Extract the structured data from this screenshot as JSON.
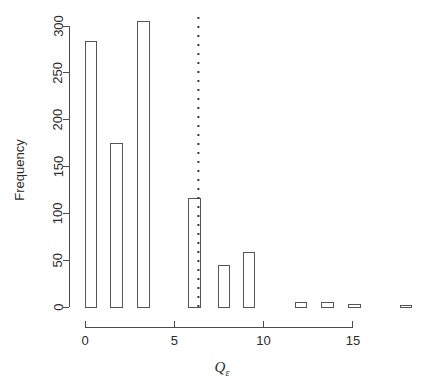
{
  "chart_data": {
    "type": "bar",
    "title": "",
    "subtitle": "",
    "xlabel": "Q",
    "xlabel_subscript": "ε",
    "ylabel": "Frequency",
    "xlim": [
      -0.6,
      18.2
    ],
    "ylim": [
      0,
      312
    ],
    "grid": false,
    "legend": null,
    "bin_width": 0.65,
    "bars": [
      {
        "left": 0.0,
        "right": 0.65,
        "center": 0.33,
        "value": 283
      },
      {
        "left": 1.45,
        "right": 2.1,
        "center": 1.78,
        "value": 175
      },
      {
        "left": 2.95,
        "right": 3.6,
        "center": 3.28,
        "value": 305
      },
      {
        "left": 5.8,
        "right": 6.45,
        "center": 6.13,
        "value": 116
      },
      {
        "left": 7.45,
        "right": 8.1,
        "center": 7.78,
        "value": 44
      },
      {
        "left": 8.85,
        "right": 9.5,
        "center": 9.18,
        "value": 58
      },
      {
        "left": 11.8,
        "right": 12.4,
        "center": 12.1,
        "value": 5
      },
      {
        "left": 13.25,
        "right": 13.9,
        "center": 13.58,
        "value": 5
      },
      {
        "left": 14.75,
        "right": 15.4,
        "center": 15.08,
        "value": 3
      },
      {
        "left": 17.65,
        "right": 18.3,
        "center": 17.98,
        "value": 2
      }
    ],
    "annotations": [
      {
        "kind": "vertical-dotted-line",
        "x": 6.35,
        "y_from": 0,
        "y_to": 312
      }
    ],
    "x_ticks": [
      {
        "value": 0,
        "label": "0"
      },
      {
        "value": 5,
        "label": "5"
      },
      {
        "value": 10,
        "label": "10"
      },
      {
        "value": 15,
        "label": "15"
      }
    ],
    "y_ticks": [
      {
        "value": 0,
        "label": "0"
      },
      {
        "value": 50,
        "label": "50"
      },
      {
        "value": 100,
        "label": "100"
      },
      {
        "value": 150,
        "label": "150"
      },
      {
        "value": 200,
        "label": "200"
      },
      {
        "value": 250,
        "label": "250"
      },
      {
        "value": 300,
        "label": "300"
      }
    ],
    "colors": {
      "bar_stroke": "#555555",
      "bar_fill": "none",
      "axis": "#4c4c4c",
      "text": "#2b2b2b",
      "dotted_line": "#3a3a3a",
      "background": "#ffffff"
    }
  }
}
